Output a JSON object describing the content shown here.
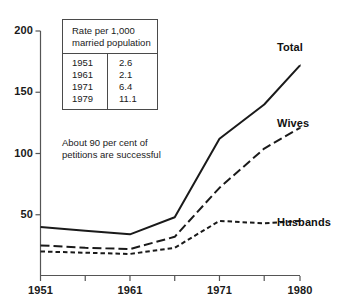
{
  "chart_data": {
    "type": "line",
    "title": "",
    "subtitle": "",
    "xlabel": "",
    "ylabel": "",
    "x": [
      1951,
      1956,
      1961,
      1966,
      1971,
      1976,
      1980
    ],
    "xlim": [
      1951,
      1980
    ],
    "ylim": [
      0,
      200
    ],
    "grid": false,
    "legend_position": "inline-right",
    "x_tick_labels": [
      "1951",
      "1961",
      "1971",
      "1980"
    ],
    "x_tick_values": [
      1951,
      1961,
      1971,
      1980
    ],
    "x_minor_tick_values": [
      1956,
      1966,
      1976
    ],
    "y_tick_labels": [
      "50",
      "100",
      "150",
      "200"
    ],
    "y_tick_values": [
      50,
      100,
      150,
      200
    ],
    "series": [
      {
        "name": "Total",
        "style": "solid",
        "values": [
          40,
          37,
          34,
          48,
          112,
          140,
          172
        ]
      },
      {
        "name": "Wives",
        "style": "long-dash",
        "values": [
          25,
          23,
          22,
          32,
          72,
          104,
          121
        ]
      },
      {
        "name": "Husbands",
        "style": "short-dash",
        "values": [
          20,
          19,
          18,
          23,
          45,
          43,
          45
        ]
      }
    ],
    "annotations": {
      "inset_table": {
        "caption": "Rate per 1,000 married population",
        "columns": [
          "Year",
          "Rate"
        ],
        "rows": [
          [
            "1951",
            "2.6"
          ],
          [
            "1961",
            "2.1"
          ],
          [
            "1971",
            "6.4"
          ],
          [
            "1979",
            "11.1"
          ]
        ]
      },
      "note": "About 90 per cent of petitions are successful"
    }
  },
  "labels": {
    "series": {
      "total": "Total",
      "wives": "Wives",
      "husbands": "Husbands"
    }
  },
  "colors": {
    "line": "#1a1a1a",
    "axis": "#555555",
    "text": "#1a1a1a",
    "background": "#ffffff"
  }
}
